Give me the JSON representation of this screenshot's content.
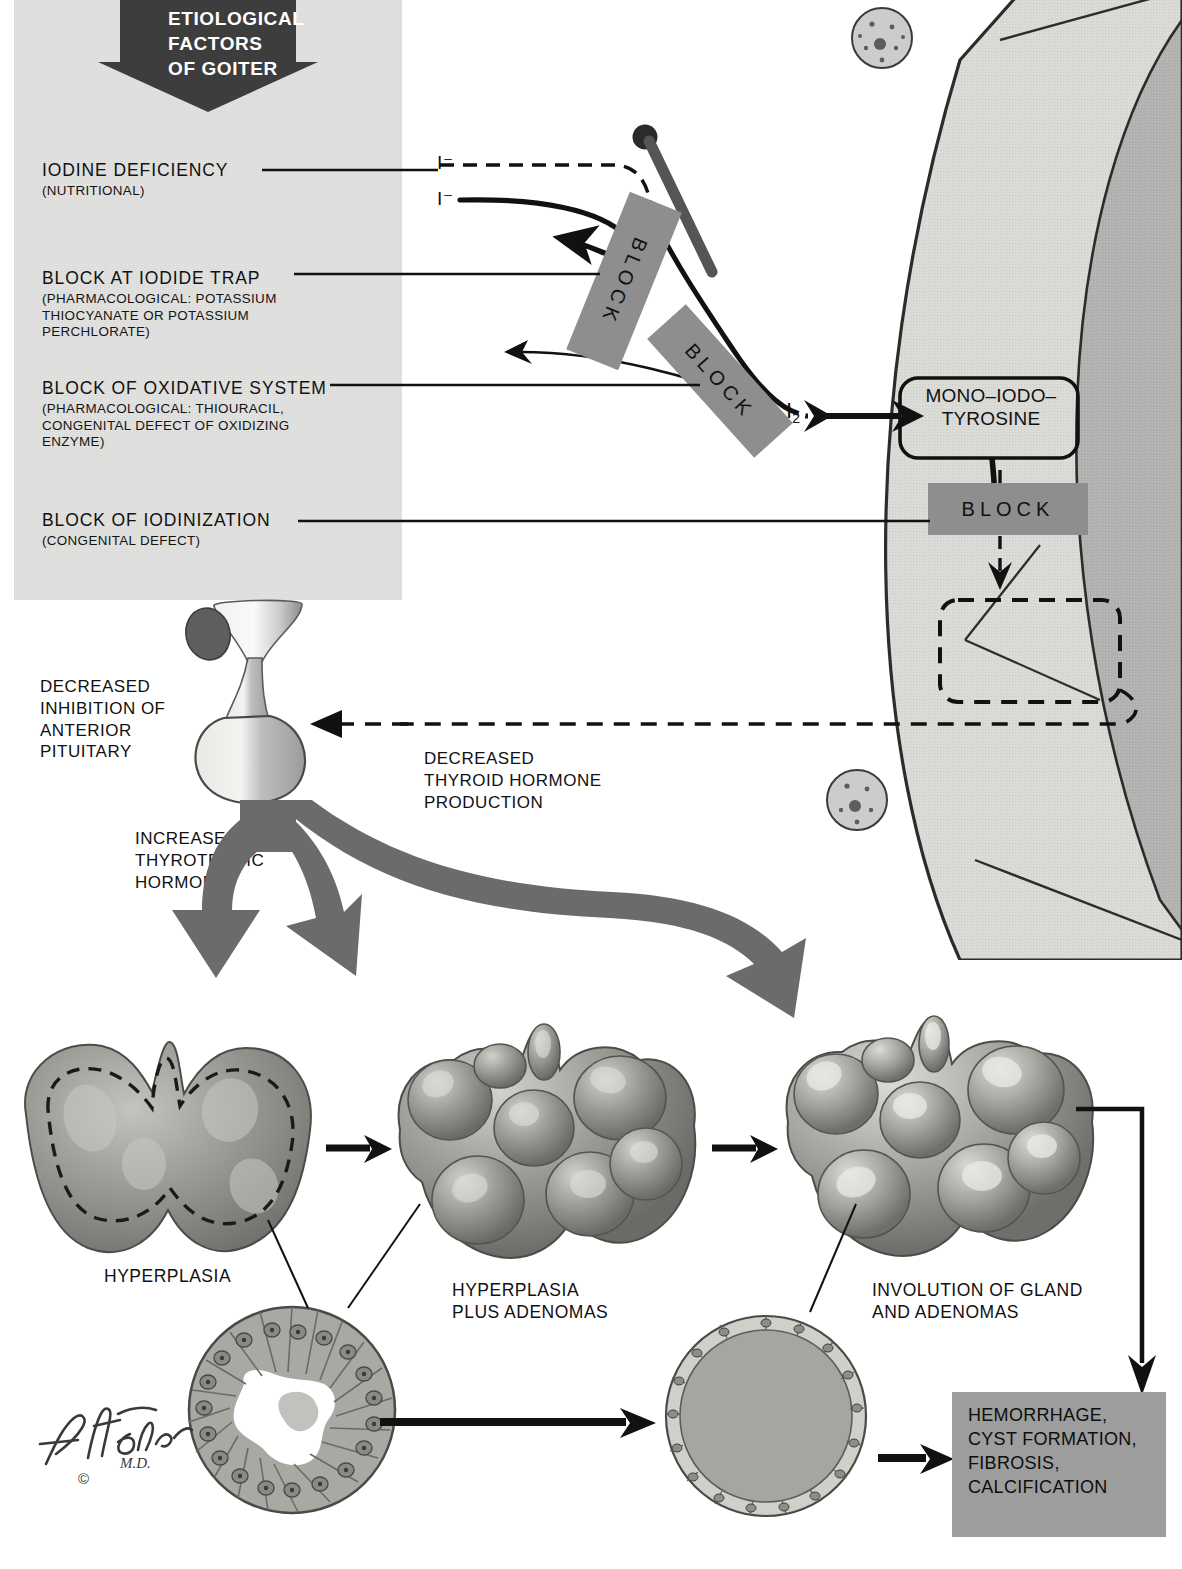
{
  "title_banner": {
    "lines": [
      "ETIOLOGICAL",
      "FACTORS",
      "OF GOITER"
    ],
    "arrow_color": "#3d3d3d"
  },
  "etiological_factors": [
    {
      "heading": "IODINE DEFICIENCY",
      "detail": "(NUTRITIONAL)"
    },
    {
      "heading": "BLOCK AT IODIDE TRAP",
      "detail": "(PHARMACOLOGICAL: POTASSIUM\nTHIOCYANATE OR POTASSIUM\nPERCHLORATE)"
    },
    {
      "heading": "BLOCK OF OXIDATIVE SYSTEM",
      "detail": "(PHARMACOLOGICAL: THIOURACIL,\nCONGENITAL DEFECT OF OXIDIZING\nENZYME)"
    },
    {
      "heading": "BLOCK OF IODINIZATION",
      "detail": "(CONGENITAL DEFECT)"
    }
  ],
  "cell_diagram": {
    "iodide_dashed_label": "I⁻",
    "iodide_solid_label": "I⁻",
    "molecular_iodine_label": "I",
    "molecular_iodine_sub": "2",
    "block_labels": [
      "BLOCK",
      "BLOCK",
      "BLOCK"
    ],
    "product_box": "MONO–IODO–\nTYROSINE",
    "product_box_line1": "MONO–IODO–",
    "product_box_line2": "TYROSINE",
    "empty_box_note": "",
    "block_fill": "#8e8e8e",
    "cell_fill": "#d9d9d6",
    "colloid_fill": "#b0b0ae"
  },
  "feedback": {
    "pituitary_label": "DECREASED\nINHIBITION OF\nANTERIOR\nPITUITARY",
    "pituitary_lines": [
      "DECREASED",
      "INHIBITION OF",
      "ANTERIOR",
      "PITUITARY"
    ],
    "hormone_label_lines": [
      "DECREASED",
      "THYROID HORMONE",
      "PRODUCTION"
    ],
    "thyrotropic_lines": [
      "INCREASED",
      "THYROTROPIC",
      "HORMONE"
    ],
    "arrow_color": "#6b6b6b"
  },
  "glands": [
    {
      "label_lines": [
        "HYPERPLASIA"
      ]
    },
    {
      "label_lines": [
        "HYPERPLASIA",
        "PLUS ADENOMAS"
      ]
    },
    {
      "label_lines": [
        "INVOLUTION OF GLAND",
        "AND ADENOMAS"
      ]
    }
  ],
  "outcome": {
    "lines": [
      "HEMORRHAGE,",
      "CYST FORMATION,",
      "FIBROSIS,",
      "CALCIFICATION"
    ],
    "bg": "#9d9d9d"
  },
  "signature": {
    "name": "F. Netter",
    "credential": "M.D.",
    "copyright": "©"
  }
}
